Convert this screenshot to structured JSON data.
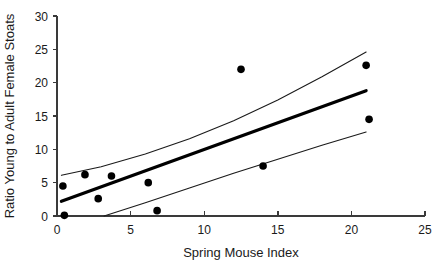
{
  "chart_data": {
    "type": "scatter",
    "title": "",
    "xlabel": "Spring Mouse Index",
    "ylabel": "Ratio Young to Adult Female Stoats",
    "xlim": [
      0,
      25
    ],
    "ylim": [
      0,
      30
    ],
    "xticks": [
      0,
      5,
      10,
      15,
      20,
      25
    ],
    "yticks": [
      0,
      5,
      10,
      15,
      20,
      25,
      30
    ],
    "xtick_labels": [
      "0",
      "5",
      "10",
      "15",
      "20",
      "25"
    ],
    "ytick_labels": [
      "0",
      "5",
      "10",
      "15",
      "20",
      "25",
      "30"
    ],
    "grid": false,
    "legend": "none",
    "points": [
      {
        "x": 0.4,
        "y": 4.5
      },
      {
        "x": 0.5,
        "y": 0.1
      },
      {
        "x": 1.9,
        "y": 6.2
      },
      {
        "x": 2.8,
        "y": 2.6
      },
      {
        "x": 3.7,
        "y": 6.0
      },
      {
        "x": 6.2,
        "y": 5.0
      },
      {
        "x": 6.8,
        "y": 0.8
      },
      {
        "x": 12.5,
        "y": 22.0
      },
      {
        "x": 14.0,
        "y": 7.5
      },
      {
        "x": 21.0,
        "y": 22.6
      },
      {
        "x": 21.2,
        "y": 14.5
      }
    ],
    "fit_line": {
      "name": "regression line",
      "x": [
        0.3,
        21.0
      ],
      "y": [
        2.2,
        18.8
      ]
    },
    "confidence_upper": {
      "name": "upper confidence band",
      "x": [
        0.3,
        3.0,
        6.0,
        9.0,
        12.0,
        15.0,
        18.0,
        21.0
      ],
      "y": [
        6.1,
        7.4,
        9.3,
        11.6,
        14.3,
        17.4,
        20.9,
        24.6
      ]
    },
    "confidence_lower": {
      "name": "lower confidence band",
      "x": [
        3.2,
        6.0,
        9.0,
        12.0,
        15.0,
        18.0,
        21.0
      ],
      "y": [
        0.0,
        2.0,
        4.2,
        6.4,
        8.5,
        10.6,
        12.6
      ]
    }
  }
}
